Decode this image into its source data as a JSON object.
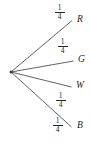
{
  "diagram": {
    "type": "probability-tree",
    "root": {
      "label": ""
    },
    "branches": [
      {
        "id": "branch-r",
        "probability": "1/4",
        "numerator": "1",
        "denominator": "4",
        "outcome": "R"
      },
      {
        "id": "branch-g",
        "probability": "1/4",
        "numerator": "1",
        "denominator": "4",
        "outcome": "G"
      },
      {
        "id": "branch-w",
        "probability": "1/4",
        "numerator": "1",
        "denominator": "4",
        "outcome": "W"
      },
      {
        "id": "branch-b",
        "probability": "1/4",
        "numerator": "1",
        "denominator": "4",
        "outcome": "B"
      }
    ],
    "colors": {
      "background": "#ffffff",
      "line": "#3a3a3a",
      "text": "#262626"
    }
  }
}
